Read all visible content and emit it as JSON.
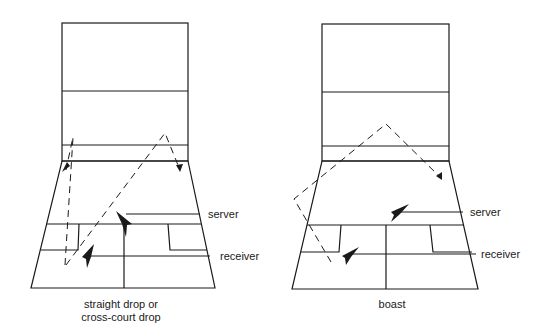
{
  "figure": {
    "panels": [
      {
        "id": "straight-drop",
        "caption_lines": [
          "straight drop or",
          "cross-court drop"
        ],
        "labels": {
          "server": "server",
          "receiver": "receiver"
        },
        "shots": [
          "straight drop",
          "cross-court drop"
        ]
      },
      {
        "id": "boast",
        "caption_lines": [
          "boast"
        ],
        "labels": {
          "server": "server",
          "receiver": "receiver"
        },
        "shots": [
          "boast"
        ]
      }
    ],
    "line_color": "#1a1a1a",
    "background": "#ffffff"
  }
}
